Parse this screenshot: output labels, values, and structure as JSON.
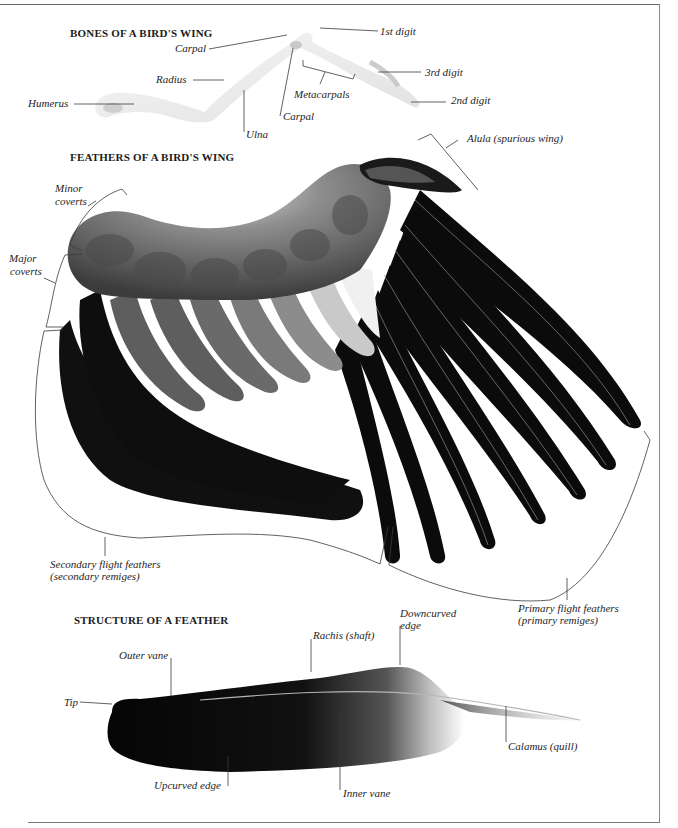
{
  "sections": {
    "bones": {
      "heading": "BONES OF A BIRD'S WING",
      "labels": {
        "carpal_upper": "Carpal",
        "radius": "Radius",
        "humerus": "Humerus",
        "ulna": "Ulna",
        "carpal_lower": "Carpal",
        "metacarpals": "Metacarpals",
        "digit_1": "1st digit",
        "digit_3": "3rd digit",
        "digit_2": "2nd digit"
      }
    },
    "feathers": {
      "heading": "FEATHERS OF A BIRD'S WING",
      "labels": {
        "alula": "Alula (spurious wing)",
        "minor_coverts_1": "Minor",
        "minor_coverts_2": "coverts",
        "major_coverts_1": "Major",
        "major_coverts_2": "coverts",
        "secondary_1": "Secondary flight feathers",
        "secondary_2": "(secondary remiges)",
        "primary_1": "Primary flight feathers",
        "primary_2": "(primary remiges)"
      }
    },
    "structure": {
      "heading": "STRUCTURE OF A FEATHER",
      "labels": {
        "downcurved_1": "Downcurved",
        "downcurved_2": "edge",
        "rachis": "Rachis (shaft)",
        "outer_vane": "Outer vane",
        "tip": "Tip",
        "calamus": "Calamus (quill)",
        "upcurved": "Upcurved edge",
        "inner_vane": "Inner vane"
      }
    }
  },
  "colors": {
    "background": "#ffffff",
    "leader_line": "#3a3a3a",
    "feather_dark": "#0c0c0c",
    "feather_gray": "#6b6b6b",
    "bone": "#e9e9e9"
  }
}
